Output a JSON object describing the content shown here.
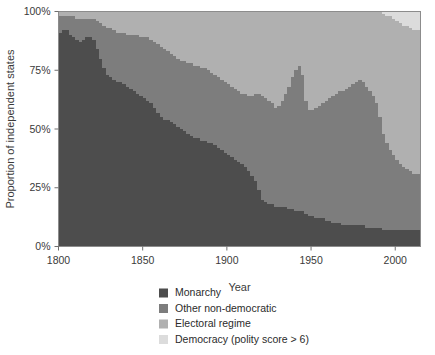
{
  "figure": {
    "title": "",
    "background_color": "#ffffff"
  },
  "axes": {
    "x_label": "Year",
    "y_label": "Proportion of independent states",
    "x_ticks": [
      "1800",
      "1850",
      "1900",
      "1950",
      "2000"
    ],
    "y_ticks": [
      "0%",
      "25%",
      "50%",
      "75%",
      "100%"
    ]
  },
  "legend": {
    "items": [
      {
        "label": "Monarchy",
        "color": "#4d4d4d"
      },
      {
        "label": "Other non-democratic",
        "color": "#7d7d7d"
      },
      {
        "label": "Electoral regime",
        "color": "#b0b0b0"
      },
      {
        "label": "Democracy (polity score > 6)",
        "color": "#dcdcdc"
      }
    ]
  },
  "chart_data": {
    "type": "area",
    "stacked": true,
    "normalized": true,
    "title": "",
    "xlabel": "Year",
    "ylabel": "Proportion of independent states",
    "xlim": [
      1800,
      2015
    ],
    "ylim": [
      0,
      100
    ],
    "xticks": [
      1800,
      1850,
      1900,
      1950,
      2000
    ],
    "yticks": [
      0,
      25,
      50,
      75,
      100
    ],
    "ytick_labels": [
      "0%",
      "25%",
      "50%",
      "75%",
      "100%"
    ],
    "grid": false,
    "legend_position": "bottom",
    "legend_entries": [
      "Monarchy",
      "Other non-democratic",
      "Electoral regime",
      "Democracy (polity score > 6)"
    ],
    "colors": [
      "#4d4d4d",
      "#7d7d7d",
      "#b0b0b0",
      "#dcdcdc"
    ],
    "stack_order_bottom_to_top": [
      "Monarchy",
      "Other non-democratic",
      "Electoral regime",
      "Democracy (polity score > 6)"
    ],
    "x": [
      1800,
      1802,
      1804,
      1806,
      1808,
      1810,
      1812,
      1814,
      1816,
      1818,
      1820,
      1822,
      1824,
      1826,
      1828,
      1830,
      1832,
      1834,
      1836,
      1838,
      1840,
      1842,
      1844,
      1846,
      1848,
      1850,
      1852,
      1854,
      1856,
      1858,
      1860,
      1862,
      1864,
      1866,
      1868,
      1870,
      1872,
      1874,
      1876,
      1878,
      1880,
      1882,
      1884,
      1886,
      1888,
      1890,
      1892,
      1894,
      1896,
      1898,
      1900,
      1902,
      1904,
      1906,
      1908,
      1910,
      1912,
      1914,
      1916,
      1918,
      1920,
      1922,
      1924,
      1926,
      1928,
      1930,
      1932,
      1934,
      1936,
      1938,
      1940,
      1942,
      1944,
      1946,
      1948,
      1950,
      1952,
      1954,
      1956,
      1958,
      1960,
      1962,
      1964,
      1966,
      1968,
      1970,
      1972,
      1974,
      1976,
      1978,
      1980,
      1982,
      1984,
      1986,
      1988,
      1990,
      1992,
      1994,
      1996,
      1998,
      2000,
      2002,
      2004,
      2006,
      2008,
      2010,
      2012,
      2015
    ],
    "series": [
      {
        "name": "Monarchy",
        "color": "#4d4d4d",
        "values": [
          91,
          92,
          92,
          90,
          89,
          88,
          87,
          88,
          89,
          89,
          88,
          84,
          80,
          76,
          73,
          72,
          71,
          70,
          70,
          69,
          68,
          67,
          66,
          65,
          64,
          63,
          62,
          61,
          59,
          57,
          55,
          54,
          54,
          53,
          52,
          51,
          50,
          49,
          48,
          47,
          46,
          46,
          45,
          45,
          44,
          44,
          43,
          42,
          41,
          40,
          39,
          38,
          37,
          36,
          35,
          34,
          32,
          30,
          28,
          24,
          20,
          19,
          18,
          18,
          17,
          17,
          17,
          17,
          16,
          16,
          15,
          15,
          15,
          14,
          13,
          13,
          12,
          12,
          12,
          11,
          11,
          10,
          10,
          10,
          9,
          9,
          9,
          9,
          9,
          9,
          9,
          8,
          8,
          8,
          8,
          8,
          7,
          7,
          7,
          7,
          7,
          7,
          7,
          7,
          7,
          7,
          7,
          7
        ]
      },
      {
        "name": "Other non-democratic",
        "color": "#7d7d7d",
        "values": [
          7,
          6,
          6,
          8,
          9,
          9,
          10,
          9,
          8,
          8,
          9,
          12,
          15,
          18,
          20,
          21,
          21,
          21,
          21,
          22,
          22,
          23,
          24,
          25,
          25,
          26,
          27,
          27,
          28,
          29,
          30,
          30,
          29,
          29,
          29,
          29,
          29,
          30,
          30,
          31,
          31,
          31,
          31,
          31,
          31,
          30,
          30,
          30,
          30,
          30,
          30,
          30,
          30,
          30,
          30,
          31,
          32,
          34,
          37,
          41,
          44,
          44,
          44,
          43,
          42,
          43,
          45,
          48,
          52,
          56,
          60,
          62,
          58,
          48,
          45,
          45,
          47,
          48,
          49,
          51,
          52,
          54,
          55,
          56,
          57,
          58,
          59,
          60,
          61,
          62,
          61,
          60,
          58,
          56,
          53,
          47,
          41,
          37,
          34,
          32,
          30,
          28,
          27,
          26,
          25,
          24,
          24,
          23
        ]
      },
      {
        "name": "Electoral regime",
        "color": "#b0b0b0",
        "values": [
          2,
          2,
          2,
          2,
          2,
          3,
          3,
          3,
          3,
          3,
          3,
          4,
          5,
          6,
          7,
          7,
          8,
          9,
          9,
          9,
          10,
          10,
          10,
          10,
          11,
          11,
          11,
          12,
          13,
          14,
          15,
          16,
          17,
          18,
          19,
          20,
          21,
          21,
          22,
          22,
          23,
          23,
          24,
          24,
          25,
          26,
          27,
          28,
          29,
          30,
          31,
          32,
          33,
          34,
          35,
          35,
          36,
          36,
          35,
          35,
          36,
          37,
          38,
          39,
          41,
          40,
          38,
          35,
          32,
          28,
          25,
          23,
          27,
          38,
          42,
          42,
          41,
          40,
          39,
          38,
          37,
          36,
          35,
          34,
          34,
          33,
          32,
          31,
          30,
          29,
          30,
          32,
          34,
          36,
          39,
          45,
          51,
          54,
          57,
          58,
          59,
          60,
          60,
          61,
          61,
          61,
          61,
          61
        ]
      },
      {
        "name": "Democracy (polity score > 6)",
        "color": "#dcdcdc",
        "values": [
          0,
          0,
          0,
          0,
          0,
          0,
          0,
          0,
          0,
          0,
          0,
          0,
          0,
          0,
          0,
          0,
          0,
          0,
          0,
          0,
          0,
          0,
          0,
          0,
          0,
          0,
          0,
          0,
          0,
          0,
          0,
          0,
          0,
          0,
          0,
          0,
          0,
          0,
          0,
          0,
          0,
          0,
          0,
          0,
          0,
          0,
          0,
          0,
          0,
          0,
          0,
          0,
          0,
          0,
          0,
          0,
          0,
          0,
          0,
          0,
          0,
          0,
          0,
          0,
          0,
          0,
          0,
          0,
          0,
          0,
          0,
          0,
          0,
          0,
          0,
          0,
          0,
          0,
          0,
          0,
          0,
          0,
          0,
          0,
          0,
          0,
          0,
          0,
          0,
          0,
          0,
          0,
          0,
          0,
          0,
          0,
          1,
          2,
          2,
          3,
          4,
          5,
          6,
          6,
          7,
          8,
          8,
          9
        ]
      }
    ]
  }
}
